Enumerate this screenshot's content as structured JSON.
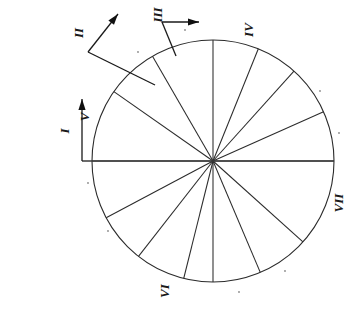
{
  "figure": {
    "background_color": "#ffffff",
    "ink_color": "#2b2b2b",
    "canvas": {
      "width": 362,
      "height": 311
    },
    "circle": {
      "center_x": 213,
      "center_y": 161,
      "radius": 121
    },
    "label_rotation_degrees": -90
  },
  "axis": {
    "name": "horizontal-diameter",
    "x_start": 82,
    "x_end": 334,
    "y": 161
  },
  "arrows": [
    {
      "id": "arrow-i",
      "label": "I",
      "corner_x": 82,
      "corner_y": 161,
      "tip_x": 82,
      "tip_y": 99,
      "label_x": 64,
      "label_y": 131
    },
    {
      "id": "arrow-ii",
      "label": "II",
      "corner_x": 88,
      "corner_y": 52,
      "tip_x": 118,
      "tip_y": 14,
      "tail_x": 155,
      "tail_y": 85,
      "label_x": 78,
      "label_y": 33
    },
    {
      "id": "arrow-iii",
      "label": "III",
      "corner_x": 162,
      "corner_y": 22,
      "tip_x": 199,
      "tip_y": 22,
      "tail_x": 176,
      "tail_y": 56,
      "label_x": 157,
      "label_y": 15
    }
  ],
  "circle_labels": [
    {
      "id": "label-iv-top-right",
      "text": "IV",
      "x": 248,
      "y": 30
    },
    {
      "id": "label-v-upper-left",
      "text": "V",
      "x": 84,
      "y": 117
    },
    {
      "id": "label-vii-right",
      "text": "VII",
      "x": 338,
      "y": 203
    },
    {
      "id": "label-vi-bottom",
      "text": "VI",
      "x": 164,
      "y": 291
    }
  ],
  "spokes": [
    {
      "id": "spoke-1",
      "angle_degrees": 90,
      "length_ratio": 1.0
    },
    {
      "id": "spoke-2",
      "angle_degrees": 120,
      "length_ratio": 1.0
    },
    {
      "id": "spoke-3",
      "angle_degrees": 145,
      "length_ratio": 1.0
    },
    {
      "id": "spoke-4",
      "angle_degrees": 180,
      "length_ratio": 1.0
    },
    {
      "id": "spoke-5",
      "angle_degrees": 208,
      "length_ratio": 1.0
    },
    {
      "id": "spoke-6",
      "angle_degrees": 232,
      "length_ratio": 1.0
    },
    {
      "id": "spoke-7",
      "angle_degrees": 256,
      "length_ratio": 1.0
    },
    {
      "id": "spoke-8",
      "angle_degrees": 270,
      "length_ratio": 1.0
    },
    {
      "id": "spoke-9",
      "angle_degrees": 293,
      "length_ratio": 1.0
    },
    {
      "id": "spoke-10",
      "angle_degrees": 318,
      "length_ratio": 1.0
    },
    {
      "id": "spoke-11",
      "angle_degrees": 0,
      "length_ratio": 1.0
    },
    {
      "id": "spoke-12",
      "angle_degrees": 24,
      "length_ratio": 1.0
    },
    {
      "id": "spoke-13",
      "angle_degrees": 48,
      "length_ratio": 1.0
    },
    {
      "id": "spoke-14",
      "angle_degrees": 68,
      "length_ratio": 1.0
    }
  ],
  "specks": [
    {
      "x": 138,
      "y": 52
    },
    {
      "x": 185,
      "y": 30
    },
    {
      "x": 320,
      "y": 91
    },
    {
      "x": 339,
      "y": 133
    },
    {
      "x": 88,
      "y": 183
    },
    {
      "x": 108,
      "y": 231
    },
    {
      "x": 285,
      "y": 271
    },
    {
      "x": 239,
      "y": 292
    }
  ]
}
